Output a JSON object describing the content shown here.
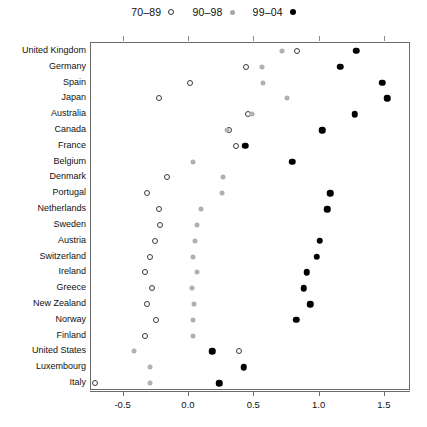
{
  "chart_data": {
    "type": "scatter",
    "title": "",
    "xlabel": "",
    "ylabel": "",
    "xlim": [
      -0.75,
      1.7
    ],
    "ylim_categories": 21,
    "grid": false,
    "legend_position": "top-center",
    "legend": [
      {
        "label": "70–89",
        "marker": "open-circle",
        "color": "#333333"
      },
      {
        "label": "90–98",
        "marker": "filled-circle",
        "color": "#b0b0b0"
      },
      {
        "label": "99–04",
        "marker": "filled-circle",
        "color": "#000000"
      }
    ],
    "xticks": [
      -0.5,
      0.0,
      0.5,
      1.0,
      1.5
    ],
    "xticklabels": [
      "-0.5",
      "0.0",
      "0.5",
      "1.0",
      "1.5"
    ],
    "categories": [
      "United Kingdom",
      "Germany",
      "Spain",
      "Japan",
      "Australia",
      "Canada",
      "France",
      "Belgium",
      "Denmark",
      "Portugal",
      "Netherlands",
      "Sweden",
      "Austria",
      "Switzerland",
      "Ireland",
      "Greece",
      "New Zealand",
      "Norway",
      "Finland",
      "United States",
      "Luxembourg",
      "Italy"
    ],
    "series": [
      {
        "name": "70–89",
        "values": [
          0.83,
          0.44,
          0.01,
          -0.23,
          0.45,
          0.31,
          0.36,
          null,
          -0.17,
          -0.32,
          -0.23,
          -0.22,
          -0.26,
          -0.3,
          -0.34,
          -0.28,
          -0.32,
          -0.25,
          -0.34,
          0.38,
          null,
          -0.72
        ]
      },
      {
        "name": "90–98",
        "values": [
          0.71,
          0.56,
          0.57,
          0.75,
          0.48,
          0.29,
          null,
          0.03,
          0.26,
          0.25,
          0.09,
          0.06,
          0.05,
          0.03,
          0.06,
          0.02,
          0.04,
          0.03,
          0.03,
          -0.42,
          -0.3,
          -0.3
        ]
      },
      {
        "name": "99–04",
        "values": [
          1.28,
          1.16,
          1.48,
          1.52,
          1.27,
          1.02,
          0.43,
          0.79,
          null,
          1.08,
          1.06,
          null,
          1.0,
          0.98,
          0.9,
          0.88,
          0.93,
          0.82,
          null,
          0.18,
          0.42,
          0.23
        ]
      }
    ]
  }
}
